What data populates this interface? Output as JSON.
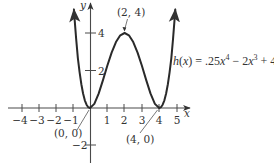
{
  "chart_data": {
    "type": "line",
    "title": "",
    "function_label": "h(x) = .25x⁴ − 2x³ + 4x²",
    "xlabel": "x",
    "ylabel": "y",
    "xlim": [
      -4.5,
      5.7
    ],
    "ylim": [
      -2.9,
      5.6
    ],
    "grid": false,
    "x_ticks": {
      "values": [
        -4,
        -3,
        -2,
        -1,
        1,
        2,
        3,
        4,
        5
      ],
      "labels": [
        "−4",
        "−3",
        "−2",
        "−1",
        "1",
        "2",
        "3",
        "4",
        "5"
      ]
    },
    "y_ticks": {
      "values": [
        4,
        2,
        -2
      ],
      "labels": [
        "4",
        "2",
        "−2"
      ]
    },
    "series": [
      {
        "name": "h(x)",
        "x": [
          -0.93,
          -0.9,
          -0.8,
          -0.7,
          -0.6,
          -0.5,
          -0.4,
          -0.3,
          -0.2,
          -0.1,
          0,
          0.25,
          0.5,
          0.75,
          1,
          1.25,
          1.5,
          1.75,
          2,
          2.25,
          2.5,
          2.75,
          3,
          3.25,
          3.5,
          3.75,
          4,
          4.1,
          4.2,
          4.3,
          4.4,
          4.5,
          4.6,
          4.7,
          4.8,
          4.9,
          4.93
        ],
        "values": [
          5.25,
          4.862,
          3.686,
          2.649,
          1.904,
          1.266,
          0.774,
          0.41,
          0.176,
          0.042,
          0,
          0.22,
          0.766,
          1.485,
          2.25,
          2.954,
          3.516,
          3.876,
          4,
          3.876,
          3.516,
          2.954,
          2.25,
          1.485,
          0.766,
          0.22,
          0,
          0.042,
          0.176,
          0.41,
          0.774,
          1.266,
          1.904,
          2.649,
          3.686,
          4.862,
          5.25
        ]
      }
    ],
    "annotations": [
      {
        "text": "(2, 4)",
        "x": 2,
        "y": 4
      },
      {
        "text": "(0, 0)",
        "x": 0,
        "y": 0
      },
      {
        "text": "(4, 0)",
        "x": 4,
        "y": 0
      }
    ],
    "pixel_map": {
      "origin_px": [
        90,
        108
      ],
      "unit_x_px": 17.3,
      "unit_y_px": 18.75
    }
  }
}
